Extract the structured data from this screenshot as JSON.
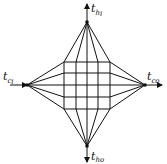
{
  "diagram": {
    "labels": {
      "top": {
        "main": "t",
        "sub": "h",
        "subsub": "i"
      },
      "bottom": {
        "main": "t",
        "sub": "h",
        "subsub": "o"
      },
      "left": {
        "main": "t",
        "sub": "c",
        "subsub": "i"
      },
      "right": {
        "main": "t",
        "sub": "c",
        "subsub": "o"
      }
    },
    "grid": {
      "rows": 4,
      "cols": 4
    },
    "colors": {
      "stroke": "#111111",
      "background": "#ffffff"
    }
  }
}
